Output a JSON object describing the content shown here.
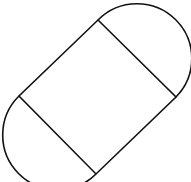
{
  "figure": {
    "stroke_color": "#111111",
    "background_color": "#ffffff",
    "stroke_width": 1.6,
    "rectangle": {
      "vertices": {
        "top": [
          98,
          20
        ],
        "right": [
          176,
          97
        ],
        "bottom": [
          96,
          174
        ],
        "left": [
          19,
          96
        ]
      }
    },
    "semicircles": [
      {
        "name": "upper-right",
        "from": [
          98,
          20
        ],
        "to": [
          176,
          97
        ],
        "radius": 55
      },
      {
        "name": "lower-left",
        "from": [
          96,
          174
        ],
        "to": [
          19,
          96
        ],
        "radius": 55
      }
    ]
  }
}
